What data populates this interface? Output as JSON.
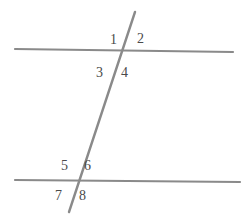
{
  "figure": {
    "background_color": "#ffffff",
    "line_color": "#8a8a8a",
    "label_color": "#4a4a4a",
    "width": 252,
    "height": 220
  },
  "lines": [
    {
      "name": "top-parallel-line",
      "x1": 15,
      "y1": 49,
      "x2": 233,
      "y2": 52,
      "stroke_width": 2.2
    },
    {
      "name": "bottom-parallel-line",
      "x1": 15,
      "y1": 180,
      "x2": 240,
      "y2": 182,
      "stroke_width": 2.2
    },
    {
      "name": "transversal-line",
      "x1": 135,
      "y1": 12,
      "x2": 69,
      "y2": 212,
      "stroke_width": 2.4
    }
  ],
  "intersections": [
    {
      "name": "upper-intersection",
      "x": 121,
      "y": 51
    },
    {
      "name": "lower-intersection",
      "x": 78,
      "y": 182
    }
  ],
  "angle_labels": [
    {
      "id": "1",
      "text": "1",
      "x": 110,
      "y": 33
    },
    {
      "id": "2",
      "text": "2",
      "x": 137,
      "y": 32
    },
    {
      "id": "3",
      "text": "3",
      "x": 96,
      "y": 66
    },
    {
      "id": "4",
      "text": "4",
      "x": 121,
      "y": 66
    },
    {
      "id": "5",
      "text": "5",
      "x": 61,
      "y": 159
    },
    {
      "id": "6",
      "text": "6",
      "x": 84,
      "y": 159
    },
    {
      "id": "7",
      "text": "7",
      "x": 55,
      "y": 189
    },
    {
      "id": "8",
      "text": "8",
      "x": 79,
      "y": 189
    }
  ]
}
